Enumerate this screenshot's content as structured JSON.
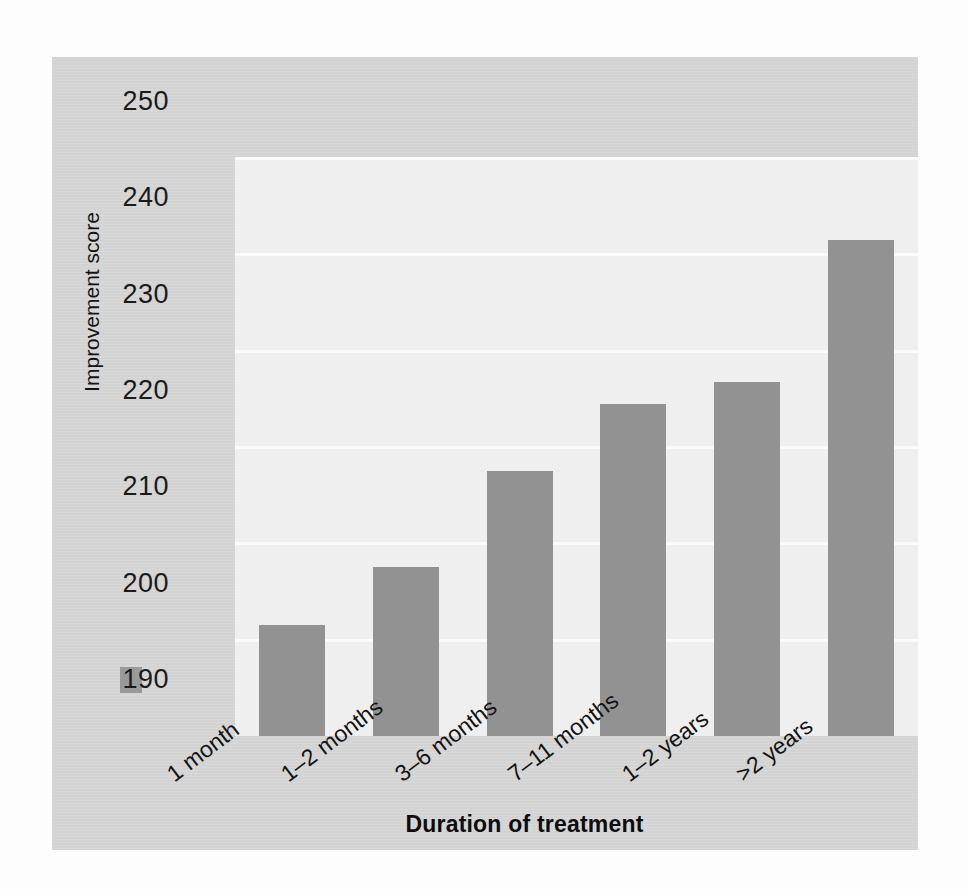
{
  "chart_data": {
    "type": "bar",
    "title": "",
    "xlabel": "Duration of treatment",
    "ylabel": "Improvement score",
    "categories": [
      "1 month",
      "1–2 months",
      "3–6 months",
      "7–11 months",
      "1–2 years",
      ">2 years"
    ],
    "values": [
      201.5,
      207.5,
      217.5,
      224.5,
      226.8,
      241.5
    ],
    "ylim": [
      190,
      250
    ],
    "ytick_labels": [
      "250",
      "240",
      "230",
      "220",
      "210",
      "200",
      "190"
    ],
    "ytick_values": [
      250,
      240,
      230,
      220,
      210,
      200,
      190
    ],
    "ystep": 10,
    "grid": true,
    "gridline_color": "#fbfbfb",
    "legend": "none",
    "bar_color": "#929292",
    "plot_bg_color": "#efefef",
    "panel_bg_color": "#d6d6d6",
    "text_color": "#141414"
  }
}
